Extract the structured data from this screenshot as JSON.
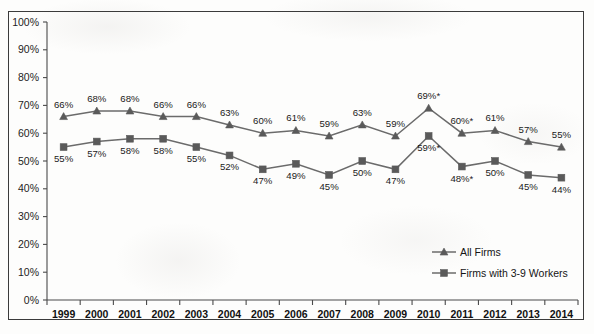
{
  "chart_data": {
    "type": "line",
    "title": "",
    "xlabel": "",
    "ylabel": "",
    "ylim": [
      0,
      100
    ],
    "ytick_labels": [
      "0%",
      "10%",
      "20%",
      "30%",
      "40%",
      "50%",
      "60%",
      "70%",
      "80%",
      "90%",
      "100%"
    ],
    "ytick_values": [
      0,
      10,
      20,
      30,
      40,
      50,
      60,
      70,
      80,
      90,
      100
    ],
    "grid": false,
    "legend_position": "inside-lower-right",
    "categories": [
      "1999",
      "2000",
      "2001",
      "2002",
      "2003",
      "2004",
      "2005",
      "2006",
      "2007",
      "2008",
      "2009",
      "2010",
      "2011",
      "2012",
      "2013",
      "2014"
    ],
    "series": [
      {
        "name": "All Firms",
        "marker": "triangle",
        "values": [
          66,
          68,
          68,
          66,
          66,
          63,
          60,
          61,
          59,
          63,
          59,
          69,
          60,
          61,
          57,
          55
        ],
        "labels": [
          "66%",
          "68%",
          "68%",
          "66%",
          "66%",
          "63%",
          "60%",
          "61%",
          "59%",
          "63%",
          "59%",
          "69%*",
          "60%*",
          "61%",
          "57%",
          "55%"
        ],
        "label_positions": [
          "above",
          "above",
          "above",
          "above",
          "above",
          "above",
          "above",
          "above",
          "above",
          "above",
          "above",
          "above",
          "above",
          "above",
          "above",
          "above"
        ]
      },
      {
        "name": "Firms with 3-9 Workers",
        "marker": "square",
        "values": [
          55,
          57,
          58,
          58,
          55,
          52,
          47,
          49,
          45,
          50,
          47,
          59,
          48,
          50,
          45,
          44
        ],
        "labels": [
          "55%",
          "57%",
          "58%",
          "58%",
          "55%",
          "52%",
          "47%",
          "49%",
          "45%",
          "50%",
          "47%",
          "59%*",
          "48%*",
          "50%",
          "45%",
          "44%"
        ],
        "label_positions": [
          "below",
          "below",
          "below",
          "below",
          "below",
          "below",
          "below",
          "below",
          "below",
          "below",
          "below",
          "below",
          "below",
          "below",
          "below",
          "below"
        ]
      }
    ],
    "colors": {
      "series_line": "#6b6b6b",
      "marker": "#5a5a5a",
      "axis": "#4a4a4a",
      "text": "#1a1a1a",
      "frame": "#3b3b3b",
      "background": "#fdfdfc"
    }
  },
  "legend": {
    "items": [
      {
        "label": "All Firms",
        "marker": "triangle"
      },
      {
        "label": "Firms with 3-9 Workers",
        "marker": "square"
      }
    ]
  }
}
